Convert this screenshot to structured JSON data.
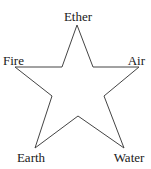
{
  "diagram": {
    "type": "pentagram",
    "labels": {
      "top": "Ether",
      "left": "Fire",
      "right": "Air",
      "bottom_left": "Earth",
      "bottom_right": "Water"
    },
    "colors": {
      "stroke": "#444444",
      "text": "#1a1a1a",
      "background": "#ffffff"
    }
  }
}
